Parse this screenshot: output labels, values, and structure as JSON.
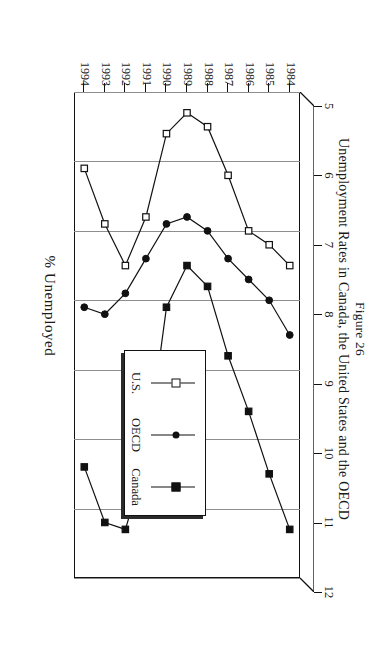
{
  "caption": {
    "figure_number": "Figure 26",
    "title": "Unemployment Rates in Canada, the United States and the OECD"
  },
  "axis": {
    "value_axis_title": "% Unemployed",
    "value_ticks": [
      "5",
      "6",
      "7",
      "8",
      "9",
      "10",
      "11",
      "12"
    ],
    "year_ticks": [
      "1984",
      "1985",
      "1986",
      "1987",
      "1988",
      "1989",
      "1990",
      "1991",
      "1992",
      "1993",
      "1994"
    ]
  },
  "legend": {
    "items": [
      {
        "label": "Canada",
        "marker": "filled-square",
        "color": "#111111"
      },
      {
        "label": "OECD",
        "marker": "filled-circle",
        "color": "#111111"
      },
      {
        "label": "U.S.",
        "marker": "open-square",
        "color": "#111111"
      }
    ]
  },
  "chart_data": {
    "type": "line",
    "title": "Unemployment Rates in Canada, the United States and the OECD",
    "subtitle": "Figure 26",
    "xlabel": "% Unemployed",
    "ylabel": "",
    "orientation": "horizontal-rotated",
    "grid": true,
    "legend_position": "inside-right-middle",
    "xlim": [
      5,
      12
    ],
    "x": [
      "1984",
      "1985",
      "1986",
      "1987",
      "1988",
      "1989",
      "1990",
      "1991",
      "1992",
      "1993",
      "1994"
    ],
    "series": [
      {
        "name": "Canada",
        "marker": "filled-square",
        "values": [
          11.3,
          10.5,
          9.6,
          8.8,
          7.8,
          7.5,
          8.1,
          10.3,
          11.3,
          11.2,
          10.4
        ]
      },
      {
        "name": "OECD",
        "marker": "filled-circle",
        "values": [
          8.5,
          8.0,
          7.7,
          7.4,
          7.0,
          6.8,
          6.9,
          7.4,
          7.9,
          8.2,
          8.1
        ]
      },
      {
        "name": "U.S.",
        "marker": "open-square",
        "values": [
          7.5,
          7.2,
          7.0,
          6.2,
          5.5,
          5.3,
          5.6,
          6.8,
          7.5,
          6.9,
          6.1
        ]
      }
    ]
  }
}
